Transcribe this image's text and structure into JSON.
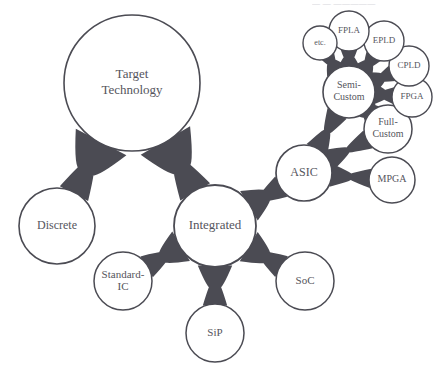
{
  "diagram": {
    "type": "node-link-taxonomy",
    "background_color": "#ffffff",
    "stroke_color": "#4b4b53",
    "edge_color": "#4b4b53",
    "label_color": "#55555d",
    "top_clipped_text": "— — —————",
    "nodes": [
      {
        "id": "target",
        "label": "Target\nTechnology",
        "lines": [
          "Target",
          "Technology"
        ],
        "cx": 132,
        "cy": 83,
        "r": 68,
        "font_size": 13,
        "stroke_width": 1.6
      },
      {
        "id": "discrete",
        "label": "Discrete",
        "lines": [
          "Discrete"
        ],
        "cx": 57,
        "cy": 226,
        "r": 38,
        "font_size": 12,
        "stroke_width": 1.6
      },
      {
        "id": "integrated",
        "label": "Integrated",
        "lines": [
          "Integrated"
        ],
        "cx": 215,
        "cy": 226,
        "r": 41,
        "font_size": 13,
        "stroke_width": 1.8
      },
      {
        "id": "standard-ic",
        "label": "Standard-IC",
        "lines": [
          "Standard-",
          "IC"
        ],
        "cx": 123,
        "cy": 281,
        "r": 29,
        "font_size": 11,
        "stroke_width": 1.5
      },
      {
        "id": "sip",
        "label": "SiP",
        "lines": [
          "SiP"
        ],
        "cx": 215,
        "cy": 333,
        "r": 29,
        "font_size": 11,
        "stroke_width": 1.5
      },
      {
        "id": "soc",
        "label": "SoC",
        "lines": [
          "SoC"
        ],
        "cx": 305,
        "cy": 281,
        "r": 29,
        "font_size": 11,
        "stroke_width": 1.5
      },
      {
        "id": "asic",
        "label": "ASIC",
        "lines": [
          "ASIC"
        ],
        "cx": 304,
        "cy": 173,
        "r": 28,
        "font_size": 12,
        "stroke_width": 1.7
      },
      {
        "id": "mpga",
        "label": "MPGA",
        "lines": [
          "MPGA"
        ],
        "cx": 392,
        "cy": 180,
        "r": 23,
        "font_size": 10,
        "stroke_width": 1.5
      },
      {
        "id": "full-custom",
        "label": "Full-Custom",
        "lines": [
          "Full-",
          "Custom"
        ],
        "cx": 388,
        "cy": 129,
        "r": 24,
        "font_size": 10,
        "stroke_width": 1.5
      },
      {
        "id": "semi-custom",
        "label": "Semi-Custom",
        "lines": [
          "Semi-",
          "Custom"
        ],
        "cx": 349,
        "cy": 92,
        "r": 26,
        "font_size": 10,
        "stroke_width": 1.6
      },
      {
        "id": "fpga",
        "label": "FPGA",
        "lines": [
          "FPGA"
        ],
        "cx": 412,
        "cy": 97,
        "r": 20,
        "font_size": 9,
        "stroke_width": 1.4
      },
      {
        "id": "cpld",
        "label": "CPLD",
        "lines": [
          "CPLD"
        ],
        "cx": 409,
        "cy": 66,
        "r": 20,
        "font_size": 9,
        "stroke_width": 1.4
      },
      {
        "id": "epld",
        "label": "EPLD",
        "lines": [
          "EPLD"
        ],
        "cx": 384,
        "cy": 41,
        "r": 20,
        "font_size": 9,
        "stroke_width": 1.4
      },
      {
        "id": "fpla",
        "label": "FPLA",
        "lines": [
          "FPLA"
        ],
        "cx": 349,
        "cy": 31,
        "r": 20,
        "font_size": 9,
        "stroke_width": 1.4
      },
      {
        "id": "etc",
        "label": "etc.",
        "lines": [
          "etc."
        ],
        "cx": 320,
        "cy": 43,
        "r": 17,
        "font_size": 8,
        "stroke_width": 1.4
      }
    ],
    "edges": [
      {
        "id": "target-discrete",
        "source": "target",
        "target": "discrete",
        "width": 16
      },
      {
        "id": "target-integrated",
        "source": "target",
        "target": "integrated",
        "width": 18
      },
      {
        "id": "integrated-standardic",
        "source": "integrated",
        "target": "standard-ic",
        "width": 13
      },
      {
        "id": "integrated-sip",
        "source": "integrated",
        "target": "sip",
        "width": 13
      },
      {
        "id": "integrated-soc",
        "source": "integrated",
        "target": "soc",
        "width": 13
      },
      {
        "id": "integrated-asic",
        "source": "integrated",
        "target": "asic",
        "width": 14
      },
      {
        "id": "asic-mpga",
        "source": "asic",
        "target": "mpga",
        "width": 10
      },
      {
        "id": "asic-fullcustom",
        "source": "asic",
        "target": "full-custom",
        "width": 10
      },
      {
        "id": "asic-semicustom",
        "source": "asic",
        "target": "semi-custom",
        "width": 11
      },
      {
        "id": "semicustom-fullcustom",
        "source": "semi-custom",
        "target": "full-custom",
        "width": 8
      },
      {
        "id": "semicustom-fpga",
        "source": "semi-custom",
        "target": "fpga",
        "width": 8
      },
      {
        "id": "semicustom-cpld",
        "source": "semi-custom",
        "target": "cpld",
        "width": 8
      },
      {
        "id": "semicustom-epld",
        "source": "semi-custom",
        "target": "epld",
        "width": 8
      },
      {
        "id": "semicustom-fpla",
        "source": "semi-custom",
        "target": "fpla",
        "width": 8
      },
      {
        "id": "semicustom-etc",
        "source": "semi-custom",
        "target": "etc",
        "width": 7
      }
    ]
  }
}
